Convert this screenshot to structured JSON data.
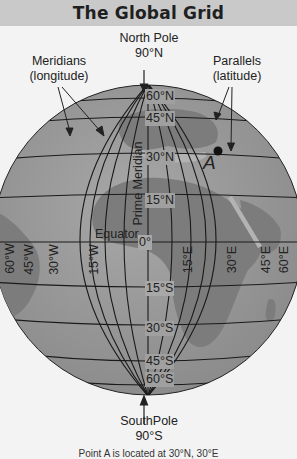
{
  "header": {
    "title": "The Global Grid"
  },
  "labels": {
    "north_pole": "North Pole",
    "north_pole_lat": "90°N",
    "south_pole": "SouthPole",
    "south_pole_lat": "90°S",
    "meridians": "Meridians",
    "meridians_sub": "(longitude)",
    "parallels": "Parallels",
    "parallels_sub": "(latitude)",
    "prime_meridian": "Prime Meridian",
    "equator": "Equator",
    "point_a": "A"
  },
  "latitudes": [
    "60°N",
    "45°N",
    "30°N",
    "15°N",
    "0°",
    "15°S",
    "30°S",
    "45°S",
    "60°S"
  ],
  "longitudes_west": [
    "60°W",
    "45°W",
    "30°W",
    "15°W"
  ],
  "longitudes_east": [
    "15°E",
    "30°E",
    "45°E",
    "60°E"
  ],
  "caption": "Point A is located at 30°N, 30°E",
  "colors": {
    "title_bar": "#c9c9c9",
    "ocean": "#9a9a9a",
    "land_dark": "#7c7c7c",
    "land_light": "#b3b3b3",
    "grid": "#1a1a1a",
    "background": "#f3f3f3"
  }
}
